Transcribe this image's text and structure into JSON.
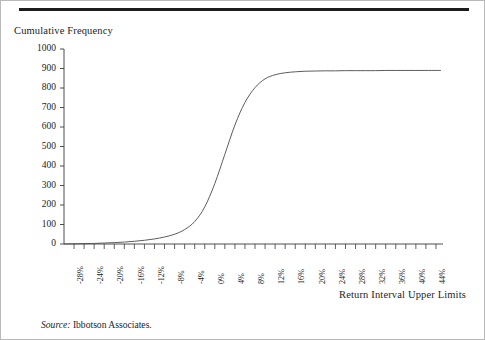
{
  "figure": {
    "y_axis_title": "Cumulative Frequency",
    "x_axis_title": "Return Interval Upper Limits",
    "source_word": "Source:",
    "source_text": " Ibbotson Associates.",
    "rule_color": "#1c1c1c",
    "curve_color": "#4a4a4a",
    "axis_color": "#3a3a3a"
  },
  "chart_data": {
    "type": "line",
    "title": "",
    "subtitle": "",
    "xlabel": "Return Interval Upper Limits",
    "ylabel": "Cumulative Frequency",
    "grid": false,
    "legend": "none",
    "xlim": [
      -30,
      45
    ],
    "ylim": [
      0,
      1000
    ],
    "y_ticks": [
      0,
      100,
      200,
      300,
      400,
      500,
      600,
      700,
      800,
      900,
      1000
    ],
    "y_tick_labels": [
      "0",
      "100",
      "200",
      "300",
      "400",
      "500",
      "600",
      "700",
      "800",
      "900",
      "1000"
    ],
    "x_tick_labels": [
      "-28%",
      "-24%",
      "-20%",
      "-16%",
      "-12%",
      "-8%",
      "-4%",
      "0%",
      "4%",
      "8%",
      "12%",
      "16%",
      "20%",
      "24%",
      "28%",
      "32%",
      "36%",
      "40%",
      "44%"
    ],
    "x_tick_values": [
      -28,
      -24,
      -20,
      -16,
      -12,
      -8,
      -4,
      0,
      4,
      8,
      12,
      16,
      20,
      24,
      28,
      32,
      36,
      40,
      44
    ],
    "x_minor_tick_interval": 2,
    "x_major_tick_interval": 4,
    "plateau_value": 890,
    "series": [
      {
        "name": "Cumulative Frequency",
        "x": [
          -30,
          -28,
          -26,
          -24,
          -22,
          -20,
          -18,
          -16,
          -14,
          -12,
          -10,
          -8,
          -6,
          -4,
          -2,
          0,
          2,
          4,
          6,
          8,
          10,
          12,
          14,
          16,
          18,
          20,
          22,
          24,
          26,
          28,
          30,
          32,
          34,
          36,
          38,
          40,
          42,
          44,
          45
        ],
        "values": [
          0,
          1,
          2,
          3,
          5,
          7,
          10,
          14,
          19,
          26,
          36,
          50,
          74,
          115,
          190,
          310,
          460,
          610,
          726,
          802,
          847,
          868,
          878,
          883,
          886,
          887,
          888,
          888,
          889,
          889,
          889,
          889,
          890,
          890,
          890,
          890,
          890,
          890,
          890
        ]
      }
    ]
  }
}
